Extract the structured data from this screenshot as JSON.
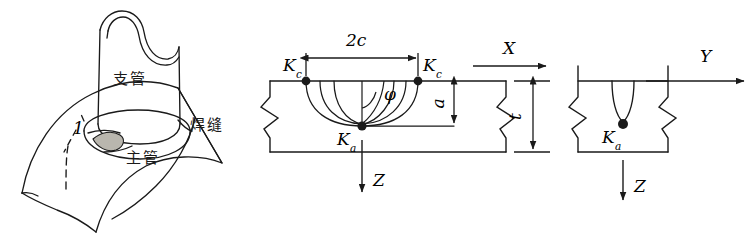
{
  "figure": {
    "kind": "engineering-fracture-mechanics-diagram",
    "panels": [
      "tubular-joint",
      "crack-cross-section",
      "crack-side-view"
    ]
  },
  "joint_panel": {
    "name": "tubular T-joint with surface crack",
    "labels": {
      "branch_pipe": "支管",
      "main_pipe": "主管",
      "weld_seam": "焊缝",
      "crack_marker": "1"
    }
  },
  "section_panel": {
    "name": "semi-elliptical surface crack cross section",
    "labels": {
      "half_width_dim": "2c",
      "crack_tip_left": "K",
      "crack_tip_left_sub": "c",
      "crack_tip_right": "K",
      "crack_tip_right_sub": "c",
      "crack_depth_point": "K",
      "crack_depth_point_sub": "a",
      "angle": "φ",
      "depth_dim": "a",
      "thickness_dim": "t",
      "axis_x": "X",
      "axis_z": "Z"
    }
  },
  "side_panel": {
    "name": "crack depth side view",
    "labels": {
      "crack_depth_point": "K",
      "crack_depth_point_sub": "a",
      "axis_y": "Y",
      "axis_z": "Z"
    }
  },
  "colors": {
    "line": "#1a1a1a",
    "crack_fill": "#b9b6ae",
    "background": "#ffffff"
  }
}
